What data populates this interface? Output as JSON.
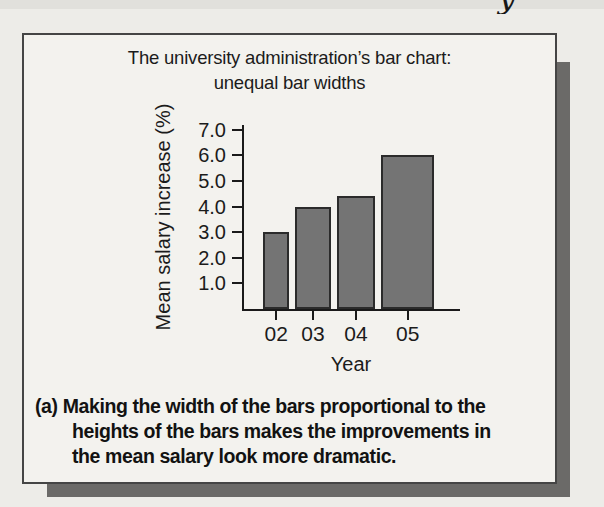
{
  "page": {
    "header_fragment": "y"
  },
  "figure": {
    "title_line1": "The university administration’s bar chart:",
    "title_line2": "unequal bar widths",
    "caption_prefix": "(a)",
    "caption_line1": "Making the width of the bars proportional to the",
    "caption_line2": "heights of the bars makes the improvements in",
    "caption_line3": "the mean salary look more dramatic."
  },
  "chart_data": {
    "type": "bar",
    "title": "The university administration’s bar chart: unequal bar widths",
    "categories": [
      "02",
      "03",
      "04",
      "05"
    ],
    "values": [
      3.0,
      4.0,
      4.4,
      6.0
    ],
    "xlabel": "Year",
    "ylabel": "Mean salary increase (%)",
    "yticks": [
      1.0,
      2.0,
      3.0,
      4.0,
      5.0,
      6.0,
      7.0
    ],
    "ylim": [
      0,
      7.2
    ],
    "bar_width_rule": "bar widths drawn proportional to bar heights (unequal widths)",
    "grid": false,
    "legend": "none",
    "colors": {
      "bar_fill": "#747474",
      "bar_border": "#2b2b2b",
      "axis": "#1a1a1a",
      "figure_background": "#f3f2ee",
      "page_background": "#edece8",
      "shadow": "#6b6a68"
    }
  }
}
